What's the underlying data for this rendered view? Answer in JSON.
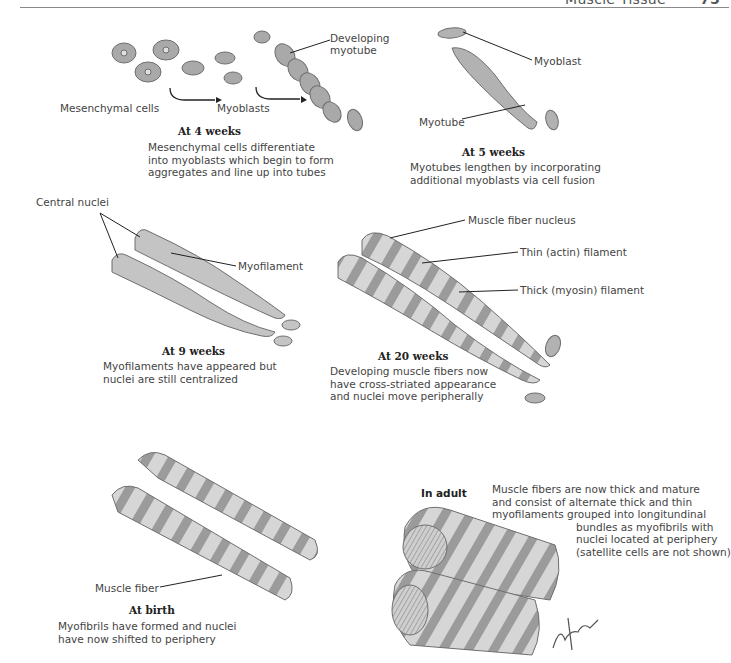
{
  "header": {
    "title": "Muscle Tissue",
    "page_number": "75"
  },
  "panels": [
    {
      "id": "4-weeks",
      "title": "At 4 weeks",
      "description": [
        "Mesenchymal cells differentiate",
        "into myoblasts which begin to form",
        "aggregates and line up into tubes"
      ],
      "labels": [
        "Mesenchymal cells",
        "Myoblasts",
        "Developing",
        "myotube"
      ]
    },
    {
      "id": "5-weeks",
      "title": "At 5 weeks",
      "description": [
        "Myotubes lengthen by incorporating",
        "additional myoblasts via cell fusion"
      ],
      "labels": [
        "Myoblast",
        "Myotube"
      ]
    },
    {
      "id": "9-weeks",
      "title": "At 9 weeks",
      "description": [
        "Myofilaments have appeared but",
        "nuclei are still centralized"
      ],
      "labels": [
        "Central nuclei",
        "Myofilament"
      ]
    },
    {
      "id": "20-weeks",
      "title": "At 20 weeks",
      "description": [
        "Developing muscle fibers now",
        "have cross-striated appearance",
        "and nuclei move peripherally"
      ],
      "labels": [
        "Muscle fiber nucleus",
        "Thin (actin) filament",
        "Thick (myosin) filament"
      ]
    },
    {
      "id": "birth",
      "title": "At birth",
      "description": [
        "Myofibrils have formed and nuclei",
        "have now shifted to periphery"
      ],
      "labels": [
        "Muscle fiber"
      ]
    },
    {
      "id": "adult",
      "title": "In adult",
      "description": [
        "Muscle fibers are now thick and mature",
        "and consist of alternate thick and thin",
        "myofilaments grouped into longitundinal",
        "bundles as myofibrils with",
        "nuclei located at periphery",
        "(satellite cells are not shown)"
      ],
      "labels": []
    }
  ],
  "signature": "F. Netter M.D.",
  "colors": {
    "cell_fill": "#b5b5b5",
    "cell_stroke": "#6e6e6e",
    "fiber_fill": "#c9c9c9",
    "line": "#222222"
  }
}
